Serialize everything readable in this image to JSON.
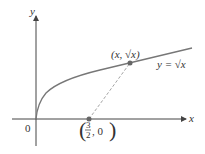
{
  "figure": {
    "axis_x_label": "x",
    "axis_y_label": "y",
    "origin_label": "0",
    "curve_label": "y = √x",
    "point_on_curve_label": "(x, √x)",
    "fixed_point_label_num": "3",
    "fixed_point_label_den": "2",
    "fixed_point_label_rest": ", 0",
    "colors": {
      "axis": "#444444",
      "curve": "#777777",
      "point": "#666666",
      "dash": "#999999"
    }
  }
}
